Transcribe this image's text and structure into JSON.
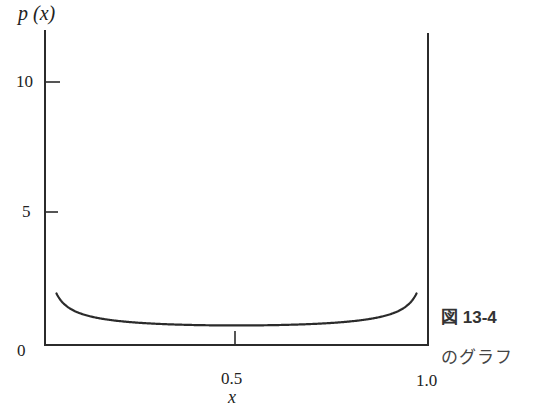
{
  "chart_data": {
    "type": "line",
    "title": "",
    "xlabel": "x",
    "ylabel": "p (x)",
    "xlim": [
      0,
      1.0
    ],
    "ylim": [
      0,
      10
    ],
    "x_ticks": [
      "0.5",
      "1.0"
    ],
    "y_ticks": [
      "0",
      "5",
      "10"
    ],
    "grid": false,
    "legend": null,
    "series": [
      {
        "name": "p(x)",
        "x": [
          0.03,
          0.05,
          0.1,
          0.2,
          0.3,
          0.4,
          0.5,
          0.6,
          0.7,
          0.8,
          0.9,
          0.95,
          0.97
        ],
        "values": [
          10.0,
          1.46,
          1.06,
          0.8,
          0.69,
          0.65,
          0.64,
          0.65,
          0.69,
          0.8,
          1.06,
          1.46,
          10.0
        ]
      }
    ]
  },
  "axes": {
    "y_label": "p (x)",
    "x_label": "x",
    "y_ticks": [
      {
        "label": "10",
        "value": 10
      },
      {
        "label": "5",
        "value": 5
      },
      {
        "label": "0",
        "value": 0
      }
    ],
    "x_ticks": [
      {
        "label": "0.5",
        "value": 0.5
      },
      {
        "label": "1.0",
        "value": 1.0
      }
    ]
  },
  "caption": {
    "title": "図 13-4",
    "subtitle": "のグラフ"
  },
  "colors": {
    "line": "#2b2b2b",
    "text": "#222222",
    "background": "#ffffff"
  }
}
